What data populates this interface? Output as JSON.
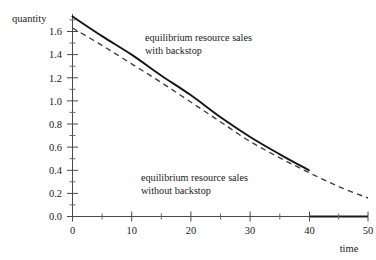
{
  "chart_data": {
    "type": "line",
    "title": "",
    "xlabel": "time",
    "ylabel": "quantity",
    "xlim": [
      0,
      50
    ],
    "ylim": [
      0.0,
      1.75
    ],
    "grid": false,
    "legend_position": "inline-annotations",
    "xticks": [
      0,
      10,
      20,
      30,
      40,
      50
    ],
    "xticklabels": [
      "0",
      "10",
      "20",
      "30",
      "40",
      "50"
    ],
    "xminor": [
      5,
      15,
      25,
      35,
      45
    ],
    "yticks": [
      0.0,
      0.2,
      0.4,
      0.6,
      0.8,
      1.0,
      1.2,
      1.4,
      1.6
    ],
    "yticklabels": [
      "0.0",
      "0.2",
      "0.4",
      "0.6",
      "0.8",
      "1.0",
      "1.2",
      "1.4",
      "1.6"
    ],
    "yminor": [
      0.1,
      0.3,
      0.5,
      0.7,
      0.9,
      1.1,
      1.3,
      1.5,
      1.7
    ],
    "series": [
      {
        "name": "equilibrium resource sales with backstop",
        "style": "solid",
        "color": "#151515",
        "x": [
          0,
          5,
          10,
          15,
          20,
          25,
          30,
          35,
          40
        ],
        "values": [
          1.73,
          1.56,
          1.4,
          1.22,
          1.05,
          0.86,
          0.69,
          0.54,
          0.4
        ],
        "note": "reaches zero at t=40 and remains at zero thereafter (bold axis segment 40-50)"
      },
      {
        "name": "equilibrium resource sales without backstop",
        "style": "dashed",
        "color": "#3c3c3c",
        "x": [
          0,
          5,
          10,
          15,
          20,
          25,
          30,
          35,
          40,
          45,
          50
        ],
        "values": [
          1.63,
          1.48,
          1.32,
          1.16,
          0.99,
          0.82,
          0.65,
          0.51,
          0.38,
          0.26,
          0.16
        ]
      }
    ],
    "annotations": [
      {
        "id": "annotation-with-backstop",
        "line1": "equilibrium resource sales",
        "line2": "with backstop",
        "x": 15.0,
        "y": 1.55
      },
      {
        "id": "annotation-without-backstop",
        "line1": "equilibrium resource sales",
        "line2": "without backstop",
        "x": 14.5,
        "y": 0.32
      }
    ],
    "zero_segment": {
      "x_start": 40,
      "x_end": 50,
      "y": 0.0
    }
  },
  "axes": {
    "y_label": "quantity",
    "x_label": "time"
  }
}
